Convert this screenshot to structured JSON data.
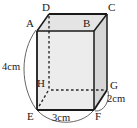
{
  "figure": {
    "type": "geometry-diagram",
    "shape": "cuboid",
    "background_color": "#ffffff",
    "stroke_color": "#1a1a1a",
    "faces": {
      "front_fill": "#ececec",
      "top_fill": "#e4e4e4",
      "right_fill": "#d6d6d6"
    }
  },
  "vertices": [
    {
      "name": "A",
      "label": "A",
      "x": 37,
      "y": 31
    },
    {
      "name": "B",
      "label": "B",
      "x": 94,
      "y": 31
    },
    {
      "name": "C",
      "label": "C",
      "x": 107,
      "y": 14
    },
    {
      "name": "D",
      "label": "D",
      "x": 49,
      "y": 14
    },
    {
      "name": "E",
      "label": "E",
      "x": 37,
      "y": 110
    },
    {
      "name": "F",
      "label": "F",
      "x": 94,
      "y": 110
    },
    {
      "name": "G",
      "label": "G",
      "x": 107,
      "y": 90
    },
    {
      "name": "H",
      "label": "H",
      "x": 49,
      "y": 90
    }
  ],
  "vertex_labels": [
    {
      "name": "A",
      "label": "A",
      "left": 26,
      "top": 18
    },
    {
      "name": "B",
      "label": "B",
      "left": 83,
      "top": 18
    },
    {
      "name": "C",
      "label": "C",
      "left": 108,
      "top": 2
    },
    {
      "name": "D",
      "label": "D",
      "left": 42,
      "top": 2
    },
    {
      "name": "E",
      "label": "E",
      "left": 27,
      "top": 111
    },
    {
      "name": "F",
      "label": "F",
      "left": 95,
      "top": 111
    },
    {
      "name": "G",
      "label": "G",
      "left": 110,
      "top": 80
    },
    {
      "name": "H",
      "label": "H",
      "left": 37,
      "top": 78
    }
  ],
  "dimensions": [
    {
      "name": "height",
      "label": "4cm",
      "edge": "A-E",
      "left": 2,
      "top": 62
    },
    {
      "name": "width",
      "label": "3cm",
      "edge": "E-F",
      "left": 52,
      "top": 113
    },
    {
      "name": "depth",
      "label": "2cm",
      "edge": "F-G",
      "left": 107,
      "top": 94
    }
  ]
}
